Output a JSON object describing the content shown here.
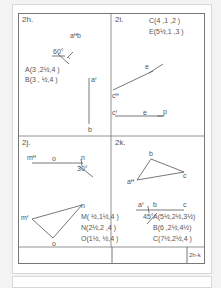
{
  "sheet": {
    "id": "2h-k",
    "title_block": [
      "",
      "",
      "2h-k"
    ]
  },
  "panels": {
    "2h": {
      "title": "2h.",
      "points": [
        "A(3 ,2½,4 )",
        "B(3 , ½,4 )"
      ],
      "labels": {
        "a_top": "aᴴb",
        "a_front": "aᶠ",
        "b": "b",
        "angle": "60°"
      }
    },
    "2i": {
      "title": "2i.",
      "points": [
        "C(4 ,1 ,2 )",
        "E(5½,1 ,3 )"
      ],
      "labels": {
        "c_top": "cᴴ",
        "e_top": "e",
        "c_front": "cᶠ",
        "e_front": "e",
        "p": "p"
      }
    },
    "2j": {
      "title": "2j.",
      "points": [
        "M( ½,1½,4 )",
        "N(2½,2 ,4 )",
        "O(1½, ½,4 )"
      ],
      "labels": {
        "m_top": "mᴴ",
        "o_top": "o",
        "n_top": "n",
        "angle": "30°",
        "m_front": "mᶠ",
        "n_front": "n",
        "o_front": "o"
      }
    },
    "2k": {
      "title": "2k.",
      "points": [
        "A(5½,2½,3½)",
        "B(6 ,2½,4½)",
        "C(7½,2½,4 )"
      ],
      "labels": {
        "a_top": "aᴴ",
        "b_top": "b",
        "c_top": "c",
        "a_front": "aᶠ",
        "b_front": "b",
        "c_front": "c",
        "angle": "45°"
      }
    }
  }
}
